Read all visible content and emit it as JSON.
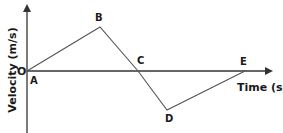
{
  "diagram": {
    "type": "velocity-time graph",
    "x_axis_label": "Time (s)",
    "y_axis_label": "Velocity (m/s)",
    "origin_label": "O",
    "points": [
      {
        "label": "A",
        "x": 27,
        "y": 71
      },
      {
        "label": "B",
        "x": 100,
        "y": 27
      },
      {
        "label": "C",
        "x": 138,
        "y": 71
      },
      {
        "label": "D",
        "x": 167,
        "y": 110
      },
      {
        "label": "E",
        "x": 245,
        "y": 71
      }
    ],
    "colors": {
      "line": "#555555",
      "axis": "#333333",
      "text": "#1a1a1a"
    }
  }
}
